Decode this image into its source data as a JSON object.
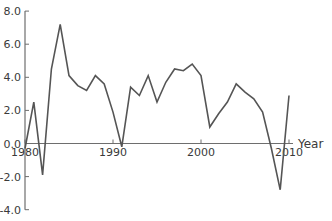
{
  "chart_data": {
    "type": "line",
    "title": "",
    "xlabel": "Year",
    "ylabel": "",
    "x": [
      1980,
      1981,
      1982,
      1983,
      1984,
      1985,
      1986,
      1987,
      1988,
      1989,
      1990,
      1991,
      1992,
      1993,
      1994,
      1995,
      1996,
      1997,
      1998,
      1999,
      2000,
      2001,
      2002,
      2003,
      2004,
      2005,
      2006,
      2007,
      2008,
      2009,
      2010
    ],
    "series": [
      {
        "name": "value",
        "values": [
          -0.3,
          2.5,
          -1.9,
          4.5,
          7.2,
          4.1,
          3.5,
          3.2,
          4.1,
          3.6,
          1.9,
          -0.2,
          3.4,
          2.9,
          4.1,
          2.5,
          3.7,
          4.5,
          4.4,
          4.8,
          4.1,
          1.0,
          1.8,
          2.5,
          3.6,
          3.1,
          2.7,
          1.9,
          -0.3,
          -2.8,
          2.9
        ],
        "color": "#555555"
      }
    ],
    "xlim": [
      1980,
      2012
    ],
    "ylim": [
      -4.0,
      8.0
    ],
    "x_ticks": [
      1980,
      1990,
      2000,
      2010
    ],
    "x_tick_labels": [
      "1980",
      "1990",
      "2000",
      "2010"
    ],
    "y_ticks": [
      8.0,
      6.0,
      4.0,
      2.0,
      0.0,
      -2.0,
      -4.0
    ],
    "y_tick_labels": [
      "8.0",
      "6.0",
      "4.0",
      "2.0",
      "0.0",
      "-2.0",
      "-4.0"
    ],
    "grid": false,
    "legend": null
  }
}
